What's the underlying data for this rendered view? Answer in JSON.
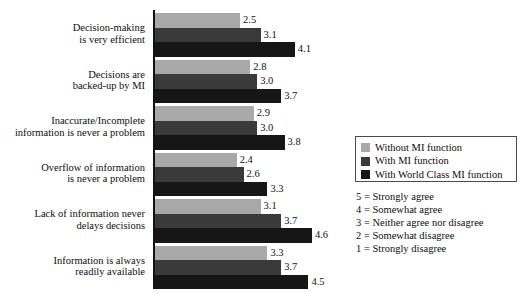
{
  "chart_data": {
    "type": "bar",
    "orientation": "horizontal",
    "title": "",
    "xlabel": "",
    "ylabel": "",
    "xlim": [
      0,
      5
    ],
    "grid": false,
    "legend_position": "right",
    "categories": [
      "Decision-making\nis very efficient",
      "Decisions are\nbacked-up by MI",
      "Inaccurate/Incomplete\ninformation is never a problem",
      "Overflow of information\nis never a problem",
      "Lack of information never\ndelays decisions",
      "Information is always\nreadily available"
    ],
    "category_lines": [
      [
        "Decision-making",
        "is very efficient"
      ],
      [
        "Decisions are",
        "backed-up by MI"
      ],
      [
        "Inaccurate/Incomplete",
        "information is never a problem"
      ],
      [
        "Overflow of information",
        "is never a problem"
      ],
      [
        "Lack of information never",
        "delays decisions"
      ],
      [
        "Information is always",
        "readily available"
      ]
    ],
    "series": [
      {
        "name": "Without MI function",
        "color": "#a9a9a9",
        "values": [
          2.5,
          2.8,
          2.9,
          2.4,
          3.1,
          3.3
        ],
        "labels": [
          "2.5",
          "2.8",
          "2.9",
          "2.4",
          "3.1",
          "3.3"
        ]
      },
      {
        "name": "With MI function",
        "color": "#3a3a3a",
        "values": [
          3.1,
          3.0,
          3.0,
          2.6,
          3.7,
          3.7
        ],
        "labels": [
          "3.1",
          "3.0",
          "3.0",
          "2.6",
          "3.7",
          "3.7"
        ]
      },
      {
        "name": "With World Class MI function",
        "color": "#161616",
        "values": [
          4.1,
          3.7,
          3.8,
          3.3,
          4.6,
          4.5
        ],
        "labels": [
          "4.1",
          "3.7",
          "3.8",
          "3.3",
          "4.6",
          "4.5"
        ]
      }
    ]
  },
  "legend": {
    "items": [
      {
        "label": "Without MI function",
        "color": "#a9a9a9"
      },
      {
        "label": "With MI function",
        "color": "#3a3a3a"
      },
      {
        "label": "With World Class MI function",
        "color": "#161616"
      }
    ]
  },
  "scale_key": {
    "lines": [
      "5 = Strongly agree",
      "4 = Somewhat agree",
      "3 = Neither agree nor disagree",
      "2 = Somewhat disagree",
      "1 = Strongly disagree"
    ]
  }
}
